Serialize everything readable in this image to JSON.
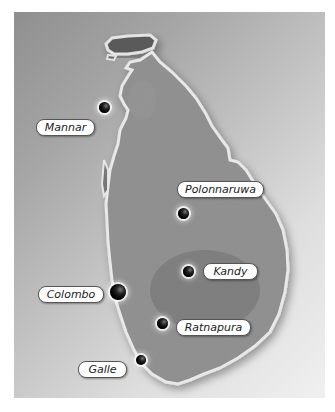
{
  "map": {
    "region": "Sri Lanka",
    "colors": {
      "sea_dark": "#8f8f8f",
      "sea_light": "#f0f0f0",
      "land": "#6e6e6e",
      "coastline": "#e6e6e6",
      "label_bg": "#ffffff",
      "label_border": "#555555",
      "label_text": "#222222"
    },
    "cities": [
      {
        "name": "Mannar",
        "dot": {
          "x": 104,
          "y": 107,
          "size": 11
        },
        "label": {
          "x": 36,
          "y": 119,
          "w": 57
        }
      },
      {
        "name": "Polonnaruwa",
        "dot": {
          "x": 183,
          "y": 213,
          "size": 11
        },
        "label": {
          "x": 177,
          "y": 181,
          "w": 85
        }
      },
      {
        "name": "Kandy",
        "dot": {
          "x": 188,
          "y": 271,
          "size": 11
        },
        "label": {
          "x": 203,
          "y": 263,
          "w": 53
        }
      },
      {
        "name": "Colombo",
        "dot": {
          "x": 118,
          "y": 292,
          "size": 16
        },
        "label": {
          "x": 38,
          "y": 286,
          "w": 64
        }
      },
      {
        "name": "Ratnapura",
        "dot": {
          "x": 162,
          "y": 323,
          "size": 11
        },
        "label": {
          "x": 176,
          "y": 319,
          "w": 73
        }
      },
      {
        "name": "Galle",
        "dot": {
          "x": 140,
          "y": 360,
          "size": 10
        },
        "label": {
          "x": 78,
          "y": 361,
          "w": 47
        }
      }
    ]
  }
}
